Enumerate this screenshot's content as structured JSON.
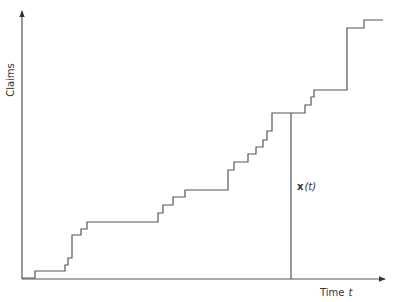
{
  "chart_data": {
    "type": "line",
    "subtype": "step",
    "title": "",
    "xlabel": "Time",
    "xlabel_var": "t",
    "ylabel": "Claims",
    "annotation": {
      "text_bold": "x",
      "text_rest": "(t)",
      "x_pixel": 291
    },
    "grid": false,
    "legend": null,
    "axis_ticks": "none",
    "colors": {
      "line": "#555555",
      "axes": "#555555",
      "text": "#333333"
    },
    "step_points_px": [
      [
        22,
        278
      ],
      [
        35,
        278
      ],
      [
        35,
        271
      ],
      [
        65,
        271
      ],
      [
        65,
        265
      ],
      [
        68,
        265
      ],
      [
        68,
        258
      ],
      [
        72,
        258
      ],
      [
        72,
        235
      ],
      [
        81,
        235
      ],
      [
        81,
        229
      ],
      [
        87,
        229
      ],
      [
        87,
        222
      ],
      [
        158,
        222
      ],
      [
        158,
        213
      ],
      [
        163,
        213
      ],
      [
        163,
        205
      ],
      [
        173,
        205
      ],
      [
        173,
        197
      ],
      [
        185,
        197
      ],
      [
        185,
        190
      ],
      [
        228,
        190
      ],
      [
        228,
        170
      ],
      [
        234,
        170
      ],
      [
        234,
        162
      ],
      [
        248,
        162
      ],
      [
        248,
        154
      ],
      [
        256,
        154
      ],
      [
        256,
        147
      ],
      [
        263,
        147
      ],
      [
        263,
        140
      ],
      [
        267,
        140
      ],
      [
        267,
        131
      ],
      [
        272,
        131
      ],
      [
        272,
        113
      ],
      [
        305,
        113
      ],
      [
        305,
        105
      ],
      [
        311,
        105
      ],
      [
        311,
        97
      ],
      [
        314,
        97
      ],
      [
        314,
        90
      ],
      [
        347,
        90
      ],
      [
        347,
        28
      ],
      [
        364,
        28
      ],
      [
        364,
        20
      ],
      [
        383,
        20
      ]
    ],
    "axes_px": {
      "origin": [
        22,
        278
      ],
      "x_end": 383,
      "y_end": 10
    }
  },
  "labels": {
    "ylabel": "Claims",
    "xlabel": "Time",
    "xvar": "t",
    "annot_bold": "x",
    "annot_rest": "(t)"
  }
}
